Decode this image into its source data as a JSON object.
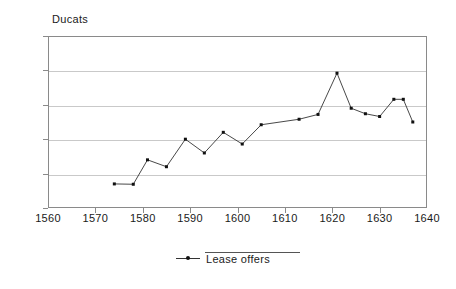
{
  "chart_data": {
    "type": "line",
    "title": "",
    "ylabel": "Ducats",
    "xlabel": "",
    "xlim": [
      1560,
      1640
    ],
    "ylim": [
      0,
      2500
    ],
    "grid": true,
    "legend_position": "bottom",
    "y_ticks": [
      0,
      500,
      1000,
      1500,
      2000,
      2500
    ],
    "y_tick_labels": [
      "0",
      "500",
      "1000",
      "1500",
      "2000",
      "2500"
    ],
    "x_ticks": [
      1560,
      1570,
      1580,
      1590,
      1600,
      1610,
      1620,
      1630,
      1640
    ],
    "x_tick_labels": [
      "1560",
      "1570",
      "1580",
      "1590",
      "1600",
      "1610",
      "1620",
      "1630",
      "1640"
    ],
    "series": [
      {
        "name": "Lease offers",
        "color": "#333333",
        "marker": "dot",
        "x": [
          1574,
          1578,
          1581,
          1585,
          1589,
          1593,
          1597,
          1601,
          1605,
          1613,
          1617,
          1621,
          1624,
          1627,
          1630,
          1633,
          1635,
          1637
        ],
        "values": [
          350,
          345,
          700,
          600,
          1000,
          800,
          1100,
          930,
          1210,
          1290,
          1360,
          1960,
          1450,
          1370,
          1330,
          1580,
          1580,
          1250
        ]
      }
    ]
  },
  "legend": {
    "entries": [
      {
        "label": "Lease offers",
        "symbol": "line-dot-marker"
      }
    ]
  },
  "axis": {
    "y_axis_title": "Ducats"
  }
}
